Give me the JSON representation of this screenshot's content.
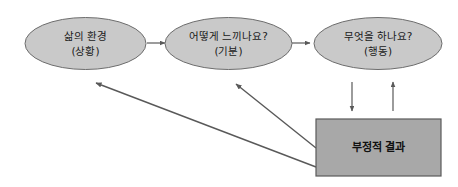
{
  "diagram": {
    "background_color": "#ffffff",
    "node_fill": "#c9c9c9",
    "node_stroke": "#6d6d6d",
    "rect_fill": "#a8a8a8",
    "rect_stroke": "#5a5a5a",
    "connector_color": "#595959",
    "nodes": [
      {
        "id": "situation",
        "shape": "ellipse",
        "line1": "삶의 환경",
        "line2": "(상황)"
      },
      {
        "id": "feeling",
        "shape": "ellipse",
        "line1": "어떻게 느끼나요?",
        "line2": "(기분)"
      },
      {
        "id": "behavior",
        "shape": "ellipse",
        "line1": "무엇을 하나요?",
        "line2": "(행동)"
      },
      {
        "id": "negative-outcome",
        "shape": "rectangle",
        "line1": "부정적 결과"
      }
    ],
    "connectors": [
      {
        "id": "situation-to-feeling",
        "type": "arrow-right"
      },
      {
        "id": "feeling-to-behavior",
        "type": "arrow-right"
      },
      {
        "id": "behavior-to-outcome",
        "type": "arrow-down"
      },
      {
        "id": "outcome-to-behavior",
        "type": "arrow-up"
      },
      {
        "id": "outcome-to-feeling",
        "type": "arrow-diagonal-upleft"
      },
      {
        "id": "outcome-to-situation",
        "type": "arrow-diagonal-upleft"
      }
    ]
  }
}
